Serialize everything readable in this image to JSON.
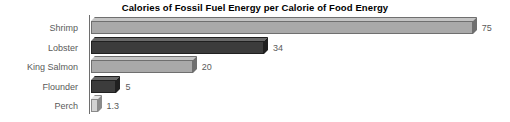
{
  "chart_data": {
    "type": "bar",
    "orientation": "horizontal",
    "title": "Calories of Fossil Fuel Energy per Calorie of Food Energy",
    "xlabel": "",
    "ylabel": "",
    "categories": [
      "Shrimp",
      "Lobster",
      "King Salmon",
      "Flounder",
      "Perch"
    ],
    "values": [
      75,
      34,
      20,
      5,
      1.3
    ],
    "value_labels": [
      "75",
      "34",
      "20",
      "5",
      "1.3"
    ],
    "xlim": [
      0,
      75
    ],
    "grid": false,
    "legend": null,
    "bars": [
      {
        "category": "Shrimp",
        "value": 75,
        "label": "75",
        "face": "#a9a9a9",
        "top": "#c4c4c4",
        "side": "#6f6f6f"
      },
      {
        "category": "Lobster",
        "value": 34,
        "label": "34",
        "face": "#3c3c3c",
        "top": "#6a6a6a",
        "side": "#202020"
      },
      {
        "category": "King Salmon",
        "value": 20,
        "label": "20",
        "face": "#a9a9a9",
        "top": "#c4c4c4",
        "side": "#6f6f6f"
      },
      {
        "category": "Flounder",
        "value": 5,
        "label": "5",
        "face": "#3c3c3c",
        "top": "#6a6a6a",
        "side": "#202020"
      },
      {
        "category": "Perch",
        "value": 1.3,
        "label": "1.3",
        "face": "#d2d2d2",
        "top": "#e6e6e6",
        "side": "#8a8a8a"
      }
    ],
    "colors": {
      "background": "#ffffff",
      "title_text": "#000000",
      "label_text": "#5a5a5a",
      "axis_line": "#6e6e6e",
      "bar_light": "#a9a9a9",
      "bar_dark": "#3c3c3c",
      "bar_lightest": "#d2d2d2"
    },
    "geometry": {
      "plot_left_px": 91,
      "px_per_unit": 5.09,
      "row_pitch_px": 19.6,
      "row_start_px": 3,
      "bar_height_px": 13,
      "depth_px": 4
    }
  }
}
